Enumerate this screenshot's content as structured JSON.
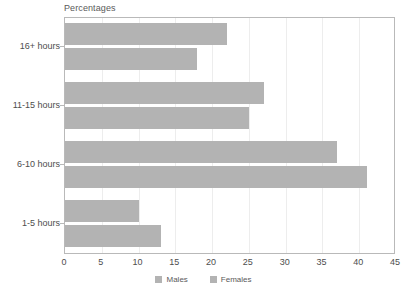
{
  "chart_data": {
    "type": "bar",
    "orientation": "horizontal",
    "title": "Percentages",
    "xlabel": "",
    "ylabel": "",
    "xlim": [
      0,
      45
    ],
    "xticks": [
      0,
      5,
      10,
      15,
      20,
      25,
      30,
      35,
      40,
      45
    ],
    "grid": true,
    "legend_position": "bottom",
    "categories": [
      "16+ hours",
      "11-15 hours",
      "6-10 hours",
      "1-5 hours"
    ],
    "series": [
      {
        "name": "Males",
        "values": [
          22,
          27,
          37,
          10
        ],
        "color": "#b3b3b3"
      },
      {
        "name": "Females",
        "values": [
          18,
          25,
          41,
          13
        ],
        "color": "#b3b3b3"
      }
    ]
  },
  "axis": {
    "tick_labels": [
      "0",
      "5",
      "10",
      "15",
      "20",
      "25",
      "30",
      "35",
      "40",
      "45"
    ]
  },
  "legend": {
    "items": [
      {
        "label": "Males"
      },
      {
        "label": "Females"
      }
    ]
  },
  "style": {
    "bar_color": "#b3b3b3",
    "grid_color": "#ededed",
    "frame_color": "#b9b9b9",
    "text_color": "#4d4d4d",
    "background": "#ffffff"
  }
}
